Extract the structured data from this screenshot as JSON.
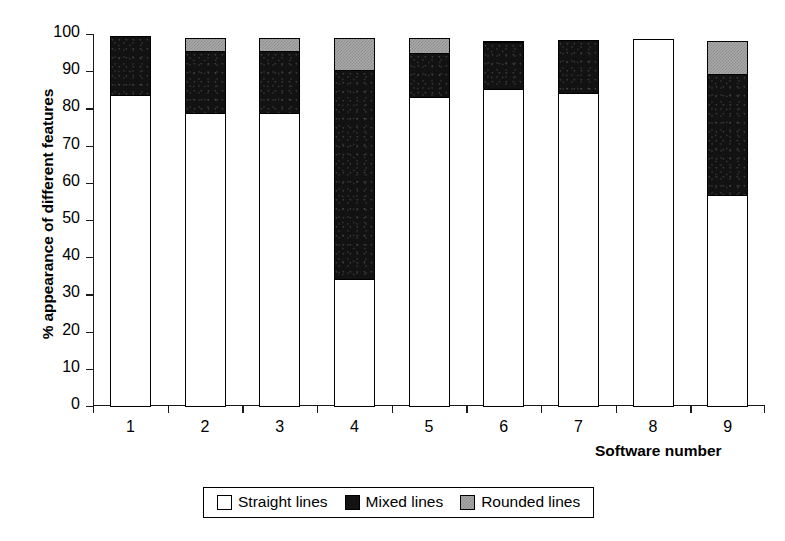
{
  "chart_data": {
    "type": "bar",
    "subtype": "stacked-bar",
    "title": "",
    "xlabel": "Software number",
    "ylabel": "% appearance of different features",
    "categories": [
      "1",
      "2",
      "3",
      "4",
      "5",
      "6",
      "7",
      "8",
      "9"
    ],
    "ylim": [
      0,
      100
    ],
    "yticks": [
      0,
      10,
      20,
      30,
      40,
      50,
      60,
      70,
      80,
      90,
      100
    ],
    "ytick_labels": [
      "0",
      "10",
      "20",
      "30",
      "40",
      "50",
      "60",
      "70",
      "80",
      "90",
      "100"
    ],
    "grid": false,
    "legend_position": "bottom-center",
    "series": [
      {
        "name": "Straight lines",
        "color": "#ffffff",
        "values": [
          84,
          79,
          79,
          34.5,
          83.5,
          85.5,
          84.5,
          99,
          57
        ]
      },
      {
        "name": "Mixed lines",
        "color": "#121212",
        "values": [
          16,
          17,
          17,
          56.5,
          12,
          13,
          14.5,
          0,
          33
        ]
      },
      {
        "name": "Rounded lines",
        "color": "#a9a9a9",
        "values": [
          0,
          4,
          4,
          9,
          4.5,
          0.5,
          0,
          0,
          9
        ]
      }
    ],
    "stack_tops": [
      100,
      100,
      100,
      100,
      100,
      99,
      99,
      99,
      99
    ]
  },
  "legend": {
    "items": [
      {
        "label": "Straight lines",
        "swatch": "white-square-icon"
      },
      {
        "label": "Mixed lines",
        "swatch": "black-square-icon"
      },
      {
        "label": "Rounded lines",
        "swatch": "gray-square-icon"
      }
    ]
  }
}
